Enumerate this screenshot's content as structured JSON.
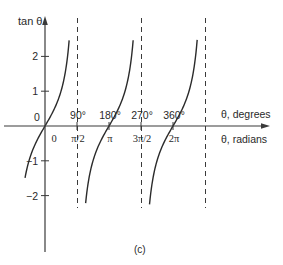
{
  "chart_data": {
    "type": "line",
    "title": "",
    "caption": "(c)",
    "function": "tan",
    "ylabel": "tan θ",
    "xlabel_degrees": "θ, degrees",
    "xlabel_radians": "θ, radians",
    "ylim": [
      -2.4,
      2.8
    ],
    "xlim_radians": [
      -0.75,
      8.4
    ],
    "y_ticks": [
      {
        "value": 2,
        "label": "2"
      },
      {
        "value": 1,
        "label": "1"
      },
      {
        "value": -1,
        "label": "−1"
      },
      {
        "value": -2,
        "label": "−2"
      }
    ],
    "origin_label_y": "0",
    "x_ticks_degrees": [
      {
        "value": 90,
        "label": "90°"
      },
      {
        "value": 180,
        "label": "180°"
      },
      {
        "value": 270,
        "label": "270°"
      },
      {
        "value": 360,
        "label": "360°"
      }
    ],
    "x_ticks_radians": [
      {
        "value": 0,
        "label": "0"
      },
      {
        "value": 1.5708,
        "label": "π/2"
      },
      {
        "value": 3.1416,
        "label": "π"
      },
      {
        "value": 4.7124,
        "label": "3π/2"
      },
      {
        "value": 6.2832,
        "label": "2π"
      }
    ],
    "asymptotes_radians": [
      1.5708,
      4.7124,
      7.854
    ],
    "branches": [
      {
        "from": -0.98,
        "to": 1.185
      },
      {
        "from": 1.995,
        "to": 4.327
      },
      {
        "from": 5.13,
        "to": 7.47
      }
    ],
    "grid": false,
    "legend": null
  },
  "colors": {
    "curve": "#2b2b2b",
    "axis": "#3a3a3a",
    "asymptote": "#3a3a3a"
  }
}
